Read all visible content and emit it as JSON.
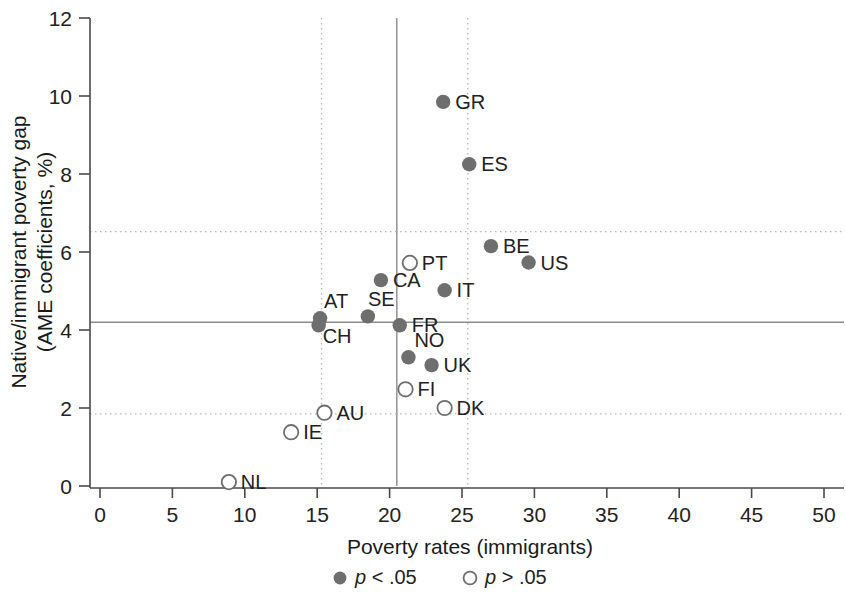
{
  "chart_data": {
    "type": "scatter",
    "title": "",
    "xlabel": "Poverty rates (immigrants)",
    "ylabel_line1": "Native/immigrant poverty gap",
    "ylabel_line2": "(AME coefficients, %)",
    "xlim": [
      0,
      50
    ],
    "ylim": [
      0,
      12
    ],
    "xticks": [
      "0",
      "5",
      "10",
      "15",
      "20",
      "25",
      "30",
      "35",
      "40",
      "45",
      "50"
    ],
    "yticks": [
      "0",
      "2",
      "4",
      "6",
      "8",
      "10",
      "12"
    ],
    "grid": false,
    "legend_position": "bottom-center",
    "legend": [
      {
        "key": "filled",
        "marker": "filled-circle",
        "label_p": "p",
        "label_rest": " < .05"
      },
      {
        "key": "hollow",
        "marker": "hollow-circle",
        "label_p": "p",
        "label_rest": " > .05"
      }
    ],
    "reference_lines": [
      {
        "name": "vertical-mean-line",
        "orientation": "vertical",
        "value": 20.5,
        "style": "solid"
      },
      {
        "name": "vertical-lower-sd-line",
        "orientation": "vertical",
        "value": 15.3,
        "style": "dotted"
      },
      {
        "name": "vertical-upper-sd-line",
        "orientation": "vertical",
        "value": 25.4,
        "style": "dotted"
      },
      {
        "name": "horizontal-mean-line",
        "orientation": "horizontal",
        "value": 4.2,
        "style": "solid"
      },
      {
        "name": "horizontal-lower-sd-line",
        "orientation": "horizontal",
        "value": 1.85,
        "style": "dotted"
      },
      {
        "name": "horizontal-upper-sd-line",
        "orientation": "horizontal",
        "value": 6.52,
        "style": "dotted"
      }
    ],
    "marker_color": "#6e6e6e",
    "points": [
      {
        "label": "GR",
        "x": 23.7,
        "y": 9.85,
        "sig": "filled",
        "lx": 12,
        "ly": 7
      },
      {
        "label": "ES",
        "x": 25.5,
        "y": 8.25,
        "sig": "filled",
        "lx": 12,
        "ly": 7
      },
      {
        "label": "BE",
        "x": 27.0,
        "y": 6.15,
        "sig": "filled",
        "lx": 12,
        "ly": 7
      },
      {
        "label": "US",
        "x": 29.6,
        "y": 5.73,
        "sig": "filled",
        "lx": 12,
        "ly": 7
      },
      {
        "label": "PT",
        "x": 21.4,
        "y": 5.72,
        "sig": "hollow",
        "lx": 12,
        "ly": 7
      },
      {
        "label": "CA",
        "x": 19.4,
        "y": 5.28,
        "sig": "filled",
        "lx": 12,
        "ly": 7
      },
      {
        "label": "IT",
        "x": 23.8,
        "y": 5.02,
        "sig": "filled",
        "lx": 12,
        "ly": 7
      },
      {
        "label": "SE",
        "x": 18.5,
        "y": 4.35,
        "sig": "filled",
        "lx": 0,
        "ly": -10
      },
      {
        "label": "AT",
        "x": 15.2,
        "y": 4.3,
        "sig": "filled",
        "lx": 4,
        "ly": -10
      },
      {
        "label": "CH",
        "x": 15.1,
        "y": 4.12,
        "sig": "filled",
        "lx": 4,
        "ly": 18
      },
      {
        "label": "FR",
        "x": 20.7,
        "y": 4.12,
        "sig": "filled",
        "lx": 12,
        "ly": 7
      },
      {
        "label": "NO",
        "x": 21.3,
        "y": 3.3,
        "sig": "filled",
        "lx": 6,
        "ly": -10
      },
      {
        "label": "UK",
        "x": 22.9,
        "y": 3.1,
        "sig": "filled",
        "lx": 12,
        "ly": 7
      },
      {
        "label": "FI",
        "x": 21.1,
        "y": 2.48,
        "sig": "hollow",
        "lx": 12,
        "ly": 7
      },
      {
        "label": "DK",
        "x": 23.8,
        "y": 2.0,
        "sig": "hollow",
        "lx": 12,
        "ly": 7
      },
      {
        "label": "AU",
        "x": 15.5,
        "y": 1.88,
        "sig": "hollow",
        "lx": 12,
        "ly": 7
      },
      {
        "label": "IE",
        "x": 13.2,
        "y": 1.38,
        "sig": "hollow",
        "lx": 12,
        "ly": 7
      },
      {
        "label": "NL",
        "x": 8.9,
        "y": 0.1,
        "sig": "hollow",
        "lx": 12,
        "ly": 7
      }
    ]
  }
}
